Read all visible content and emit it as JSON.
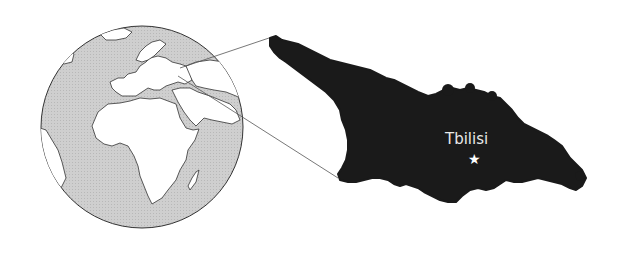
{
  "map": {
    "globe": {
      "center": [
        142,
        127
      ],
      "radius": 101,
      "ocean_color": "#c8c8c8",
      "land_color": "#ffffff",
      "outline_color": "#333333"
    },
    "inset": {
      "region": "Georgia",
      "fill_color": "#1a1a1a"
    },
    "capital": {
      "label": "Tbilisi",
      "marker": "★",
      "marker_icon": "star-icon"
    }
  }
}
